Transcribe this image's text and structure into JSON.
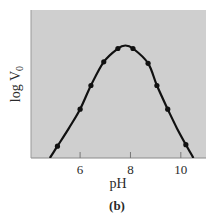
{
  "figure": {
    "panel_label": "(b)"
  },
  "chart_data": {
    "type": "line",
    "title": "",
    "xlabel": "pH",
    "ylabel": "log V",
    "ylabel_subscript": "0",
    "xlim": [
      4.05,
      11.0
    ],
    "ylim": [
      0,
      1
    ],
    "y_scale_note": "relative (no y tick labels shown)",
    "x_ticks": [
      6,
      8,
      10
    ],
    "x_tick_labels": [
      "6",
      "8",
      "10"
    ],
    "y_ticks": [],
    "grid": false,
    "legend": null,
    "background": "#cfcfcf",
    "line_color": "#111111",
    "series": [
      {
        "name": "log V0 vs pH",
        "markers": true,
        "points": [
          {
            "x": 5.1,
            "y": 0.08
          },
          {
            "x": 6.0,
            "y": 0.33
          },
          {
            "x": 6.43,
            "y": 0.49
          },
          {
            "x": 6.94,
            "y": 0.65
          },
          {
            "x": 7.5,
            "y": 0.74
          },
          {
            "x": 8.1,
            "y": 0.74
          },
          {
            "x": 8.7,
            "y": 0.64
          },
          {
            "x": 9.05,
            "y": 0.49
          },
          {
            "x": 9.48,
            "y": 0.33
          },
          {
            "x": 10.2,
            "y": 0.09
          }
        ],
        "curve": [
          {
            "x": 4.8,
            "y": 0.0
          },
          {
            "x": 5.1,
            "y": 0.08
          },
          {
            "x": 5.55,
            "y": 0.2
          },
          {
            "x": 6.0,
            "y": 0.33
          },
          {
            "x": 6.43,
            "y": 0.49
          },
          {
            "x": 6.94,
            "y": 0.65
          },
          {
            "x": 7.5,
            "y": 0.74
          },
          {
            "x": 7.8,
            "y": 0.76
          },
          {
            "x": 8.1,
            "y": 0.74
          },
          {
            "x": 8.7,
            "y": 0.64
          },
          {
            "x": 9.05,
            "y": 0.49
          },
          {
            "x": 9.48,
            "y": 0.33
          },
          {
            "x": 9.85,
            "y": 0.2
          },
          {
            "x": 10.2,
            "y": 0.09
          },
          {
            "x": 10.5,
            "y": 0.0
          }
        ]
      }
    ]
  }
}
